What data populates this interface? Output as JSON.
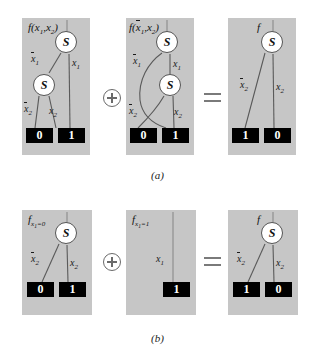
{
  "figure": {
    "caption_a": "(a)",
    "caption_b": "(b)",
    "node_symbol": "S",
    "operator_plus": "plus-circle-icon",
    "operator_equals": "equals-icon"
  },
  "row_a": {
    "panel1": {
      "function_label_f": "f",
      "function_label_args": "(x1,x2)",
      "nodes": [
        {
          "symbol": "S"
        },
        {
          "symbol": "S"
        }
      ],
      "edges": [
        {
          "label": "x1",
          "negated": true
        },
        {
          "label": "x1",
          "negated": false
        },
        {
          "label": "x2",
          "negated": true
        },
        {
          "label": "x2",
          "negated": false
        }
      ],
      "terminals": [
        "0",
        "1"
      ]
    },
    "panel2": {
      "function_label_f": "f",
      "function_label_args": "(x1,x2)",
      "function_label_arg1_negated": true,
      "nodes": [
        {
          "symbol": "S"
        },
        {
          "symbol": "S"
        }
      ],
      "edges": [
        {
          "label": "x1",
          "negated": true
        },
        {
          "label": "x1",
          "negated": false
        },
        {
          "label": "x2",
          "negated": true
        },
        {
          "label": "x2",
          "negated": false
        }
      ],
      "terminals": [
        "0",
        "1"
      ]
    },
    "panel3": {
      "function_label_f": "f",
      "nodes": [
        {
          "symbol": "S"
        }
      ],
      "edges": [
        {
          "label": "x2",
          "negated": true
        },
        {
          "label": "x2",
          "negated": false
        }
      ],
      "terminals": [
        "1",
        "0"
      ]
    }
  },
  "row_b": {
    "panel1": {
      "function_label_f": "f",
      "function_label_sub": "x1=0",
      "nodes": [
        {
          "symbol": "S"
        }
      ],
      "edges": [
        {
          "label": "x2",
          "negated": true
        },
        {
          "label": "x2",
          "negated": false
        }
      ],
      "terminals": [
        "0",
        "1"
      ]
    },
    "panel2": {
      "function_label_f": "f",
      "function_label_sub": "x1=1",
      "nodes": [],
      "edges": [
        {
          "label": "x1",
          "negated": false
        }
      ],
      "terminals": [
        "1"
      ]
    },
    "panel3": {
      "function_label_f": "f",
      "nodes": [
        {
          "symbol": "S"
        }
      ],
      "edges": [
        {
          "label": "x2",
          "negated": true
        },
        {
          "label": "x2",
          "negated": false
        }
      ],
      "terminals": [
        "1",
        "0"
      ]
    }
  }
}
